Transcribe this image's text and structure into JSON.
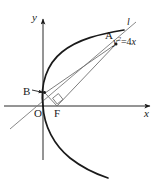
{
  "figure": {
    "kind": "geometry-diagram",
    "width": 160,
    "height": 191,
    "background_color": "#ffffff",
    "stroke_color": "#1a1a1a",
    "thin_stroke_color": "#6b6b6b",
    "axes": {
      "x_label": "x",
      "y_label": "y",
      "origin_label": "O",
      "origin": {
        "x": 43,
        "y": 106
      },
      "x_axis_start": {
        "x": 4,
        "y": 106
      },
      "x_axis_end": {
        "x": 152,
        "y": 106
      },
      "y_axis_top": {
        "x": 43,
        "y": 17
      },
      "y_axis_bottom": {
        "x": 43,
        "y": 160
      }
    },
    "curve": {
      "equation_label": "y",
      "equation_exponent": "2",
      "equation_rest": "=4x",
      "type": "parabola",
      "opens": "right",
      "vertex": {
        "x": 43,
        "y": 106
      }
    },
    "points": [
      {
        "name": "A",
        "label": "A",
        "x": 116,
        "y": 44
      },
      {
        "name": "B",
        "label": "B",
        "x": 45,
        "y": 93
      },
      {
        "name": "F",
        "label": "F",
        "x": 57,
        "y": 106
      },
      {
        "name": "O",
        "label": "O",
        "x": 43,
        "y": 106
      }
    ],
    "segments": [
      {
        "name": "segment-AB",
        "from": "A",
        "to": "B"
      },
      {
        "name": "segment-AF",
        "from": "A",
        "to": "F"
      },
      {
        "name": "segment-BF",
        "from": "B",
        "to": "F"
      }
    ],
    "tangent_line": {
      "name": "line-l",
      "label": "l",
      "from": {
        "x": 10,
        "y": 129
      },
      "to": {
        "x": 136,
        "y": 22
      }
    },
    "right_angle_marker": {
      "name": "right-angle-at-F",
      "vertex": {
        "x": 57,
        "y": 106
      }
    },
    "annotations": {
      "b_arrow": {
        "name": "b-pointer-arrow",
        "from": {
          "x": 33,
          "y": 90
        },
        "to": {
          "x": 44,
          "y": 93
        }
      }
    }
  }
}
